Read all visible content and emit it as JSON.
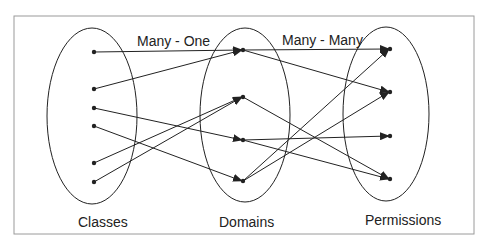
{
  "labels": {
    "relation_left": "Many - One",
    "relation_right": "Many - Many",
    "set_classes": "Classes",
    "set_domains": "Domains",
    "set_permissions": "Permissions"
  },
  "colors": {
    "stroke": "#222222",
    "frame": "#9a9a9a",
    "background": "#ffffff"
  },
  "sets": {
    "classes": {
      "ellipse": {
        "cx": 142,
        "cy": 116,
        "rx": 45,
        "ry": 88
      },
      "x": 94,
      "points": [
        52,
        89,
        108,
        126,
        163,
        182
      ]
    },
    "domains": {
      "ellipse": {
        "cx": 245,
        "cy": 115,
        "rx": 45,
        "ry": 87
      },
      "x": 243,
      "points": [
        50,
        97,
        140,
        181
      ]
    },
    "permissions": {
      "ellipse": {
        "cx": 390,
        "cy": 114,
        "rx": 43,
        "ry": 87
      },
      "x": 390,
      "points": [
        49,
        92,
        136,
        179
      ]
    }
  },
  "edges_class_to_domain": [
    [
      0,
      0
    ],
    [
      1,
      0
    ],
    [
      2,
      2
    ],
    [
      3,
      3
    ],
    [
      4,
      1
    ],
    [
      5,
      1
    ]
  ],
  "edges_domain_to_permission": [
    [
      0,
      0
    ],
    [
      0,
      1
    ],
    [
      1,
      3
    ],
    [
      2,
      2
    ],
    [
      2,
      3
    ],
    [
      3,
      0
    ],
    [
      3,
      1
    ]
  ]
}
